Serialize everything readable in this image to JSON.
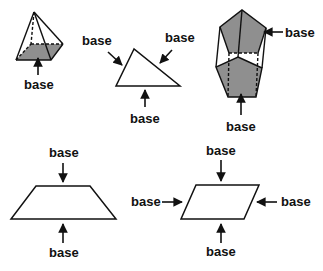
{
  "colors": {
    "stroke": "#111111",
    "fill_base": "#8f8f8f",
    "background": "#ffffff"
  },
  "labels": {
    "pyramid_base": "base",
    "triangle_left": "base",
    "triangle_right": "base",
    "triangle_bottom": "base",
    "prism_top": "base",
    "prism_bottom": "base",
    "trapezoid_top": "base",
    "trapezoid_bottom": "base",
    "parallelogram_top": "base",
    "parallelogram_left": "base",
    "parallelogram_right": "base",
    "parallelogram_bottom": "base"
  },
  "shapes": [
    {
      "name": "square-pyramid",
      "bases_labeled": 1
    },
    {
      "name": "triangle",
      "bases_labeled": 3
    },
    {
      "name": "pentagonal-prism",
      "bases_labeled": 2
    },
    {
      "name": "trapezoid",
      "bases_labeled": 2
    },
    {
      "name": "parallelogram",
      "bases_labeled": 4
    }
  ]
}
